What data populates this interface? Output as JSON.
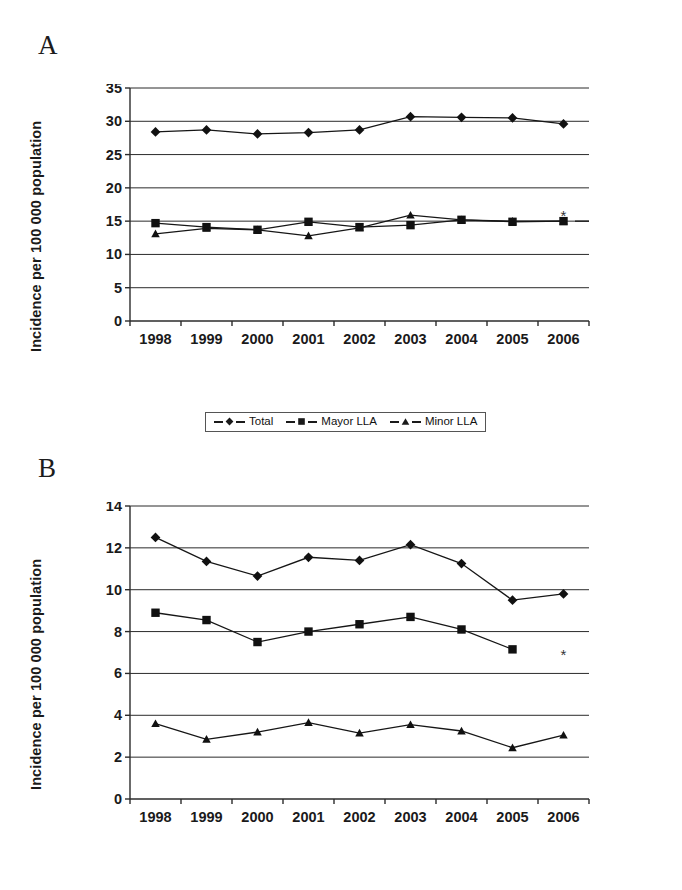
{
  "figure": {
    "panels": [
      {
        "letter": "A"
      },
      {
        "letter": "B"
      }
    ]
  },
  "legend": {
    "entries": [
      {
        "label": "Total",
        "marker": "diamond"
      },
      {
        "label": "Mayor LLA",
        "marker": "square"
      },
      {
        "label": "Minor LLA",
        "marker": "triangle"
      }
    ]
  },
  "chart_data": [
    {
      "type": "line",
      "panel": "A",
      "title": "",
      "xlabel": "",
      "ylabel": "Incidence per 100 000 population",
      "categories": [
        "1998",
        "1999",
        "2000",
        "2001",
        "2002",
        "2003",
        "2004",
        "2005",
        "2006"
      ],
      "x": [
        1998,
        1999,
        2000,
        2001,
        2002,
        2003,
        2004,
        2005,
        2006
      ],
      "ylim": [
        0,
        35
      ],
      "yticks": [
        0,
        5,
        10,
        15,
        20,
        25,
        30,
        35
      ],
      "grid": true,
      "legend_position": "bottom",
      "series": [
        {
          "name": "Total",
          "marker": "diamond",
          "values": [
            28.4,
            28.7,
            28.1,
            28.3,
            28.7,
            30.7,
            30.6,
            30.5,
            29.6
          ]
        },
        {
          "name": "Mayor LLA",
          "marker": "square",
          "values": [
            14.7,
            14.1,
            13.7,
            14.9,
            14.1,
            14.4,
            15.2,
            14.9,
            15.0
          ]
        },
        {
          "name": "Minor LLA",
          "marker": "triangle",
          "values": [
            13.1,
            13.9,
            13.7,
            12.8,
            14.0,
            15.9,
            15.2,
            15.0,
            15.0
          ]
        }
      ],
      "annotations": [
        {
          "text": "*",
          "x": 2006,
          "y": 15.6,
          "note": "asterisk marking provisional 2006 value"
        }
      ]
    },
    {
      "type": "line",
      "panel": "B",
      "title": "",
      "xlabel": "",
      "ylabel": "Incidence per 100 000 population",
      "categories": [
        "1998",
        "1999",
        "2000",
        "2001",
        "2002",
        "2003",
        "2004",
        "2005",
        "2006"
      ],
      "x": [
        1998,
        1999,
        2000,
        2001,
        2002,
        2003,
        2004,
        2005,
        2006
      ],
      "ylim": [
        0,
        14
      ],
      "yticks": [
        0,
        2,
        4,
        6,
        8,
        10,
        12,
        14
      ],
      "grid": true,
      "legend_position": "bottom",
      "series": [
        {
          "name": "Total",
          "marker": "diamond",
          "values": [
            12.5,
            11.35,
            10.65,
            11.55,
            11.4,
            12.15,
            11.25,
            9.5,
            9.8
          ]
        },
        {
          "name": "Mayor LLA",
          "marker": "square",
          "values": [
            8.9,
            8.55,
            7.5,
            8.0,
            8.35,
            8.7,
            8.1,
            7.15,
            null
          ]
        },
        {
          "name": "Minor LLA",
          "marker": "triangle",
          "values": [
            3.6,
            2.85,
            3.2,
            3.65,
            3.15,
            3.55,
            3.25,
            2.45,
            3.05
          ]
        }
      ],
      "annotations": [
        {
          "text": "*",
          "x": 2006,
          "y": 6.85,
          "note": "asterisk marking provisional 2006 value"
        }
      ]
    }
  ]
}
